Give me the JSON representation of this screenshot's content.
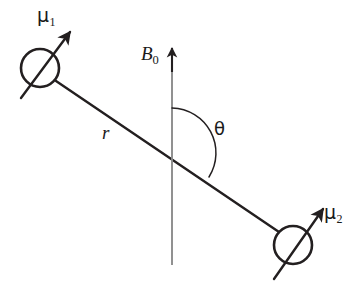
{
  "figure": {
    "kind": "physics-vector-diagram",
    "background_color": "#ffffff",
    "stroke_color": "#231f20",
    "width": 363,
    "height": 295
  },
  "labels": {
    "mu1": {
      "symbol": "μ",
      "subscript": "1",
      "text": "μ₁"
    },
    "mu2": {
      "symbol": "μ",
      "subscript": "2",
      "text": "μ₂"
    },
    "b0": {
      "symbol": "B",
      "subscript": "0",
      "text": "B₀"
    },
    "r": {
      "symbol": "r",
      "subscript": "",
      "text": "r"
    },
    "theta": {
      "symbol": "θ",
      "subscript": "",
      "text": "θ"
    }
  },
  "geometry": {
    "spin1_circle": {
      "cx": 40,
      "cy": 68,
      "r": 19
    },
    "spin2_circle": {
      "cx": 293,
      "cy": 245,
      "r": 19
    },
    "internuclear_vector": {
      "x1": 56,
      "y1": 81,
      "x2": 279,
      "y2": 232
    },
    "field_axis": {
      "x": 172,
      "y_tip": 47,
      "y_base": 265
    },
    "axis_intersection": {
      "x": 172,
      "y": 153
    },
    "theta_arc": {
      "cx": 172,
      "cy": 153,
      "r": 45,
      "start_deg": 90,
      "end_deg": -34
    },
    "mu1_arrow": {
      "x1": 21,
      "y1": 98,
      "x2": 71,
      "y2": 31
    },
    "mu2_arrow": {
      "x1": 274,
      "y1": 279,
      "x2": 324,
      "y2": 207
    }
  },
  "colors": {
    "ink": "#231f20",
    "paper": "#ffffff"
  }
}
